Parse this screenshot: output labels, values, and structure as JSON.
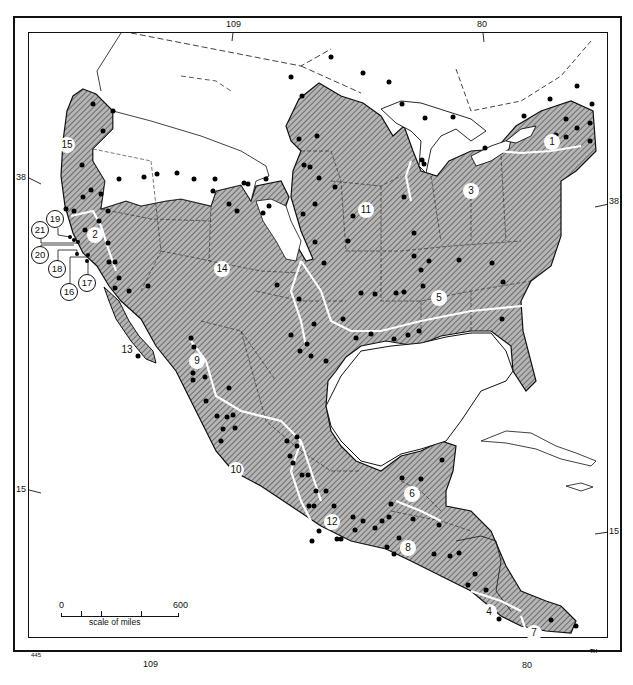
{
  "map": {
    "title": "",
    "colors": {
      "land_shaded": "#9a9a9a",
      "land_unshaded": "#ffffff",
      "border": "#111111",
      "region_divider": "#ffffff",
      "site_dot": "#000000"
    },
    "graticule": {
      "top_longitudes": [
        "109",
        "80"
      ],
      "bottom_longitudes": [
        "109",
        "80"
      ],
      "left_latitudes": [
        "38",
        "15"
      ],
      "right_latitudes": [
        "38",
        "15"
      ]
    },
    "region_labels": [
      {
        "id": "1",
        "x": 552,
        "y": 142
      },
      {
        "id": "2",
        "x": 95,
        "y": 235
      },
      {
        "id": "3",
        "x": 471,
        "y": 191
      },
      {
        "id": "4",
        "x": 489,
        "y": 612
      },
      {
        "id": "5",
        "x": 439,
        "y": 298
      },
      {
        "id": "6",
        "x": 412,
        "y": 494
      },
      {
        "id": "7",
        "x": 534,
        "y": 633
      },
      {
        "id": "8",
        "x": 408,
        "y": 548
      },
      {
        "id": "9",
        "x": 197,
        "y": 361
      },
      {
        "id": "10",
        "x": 236,
        "y": 470
      },
      {
        "id": "11",
        "x": 366,
        "y": 210
      },
      {
        "id": "12",
        "x": 332,
        "y": 522
      },
      {
        "id": "13",
        "x": 127,
        "y": 350
      },
      {
        "id": "14",
        "x": 222,
        "y": 269
      },
      {
        "id": "15",
        "x": 67,
        "y": 145
      }
    ],
    "site_callouts": [
      {
        "id": "19",
        "x": 55,
        "y": 219
      },
      {
        "id": "21",
        "x": 40,
        "y": 230
      },
      {
        "id": "20",
        "x": 40,
        "y": 255
      },
      {
        "id": "18",
        "x": 57,
        "y": 269
      },
      {
        "id": "16",
        "x": 69,
        "y": 292
      },
      {
        "id": "17",
        "x": 87,
        "y": 283
      }
    ],
    "scale": {
      "start_label": "0",
      "end_label": "600",
      "caption": "scale of miles"
    },
    "corner_code": "445",
    "credit": "TH"
  }
}
